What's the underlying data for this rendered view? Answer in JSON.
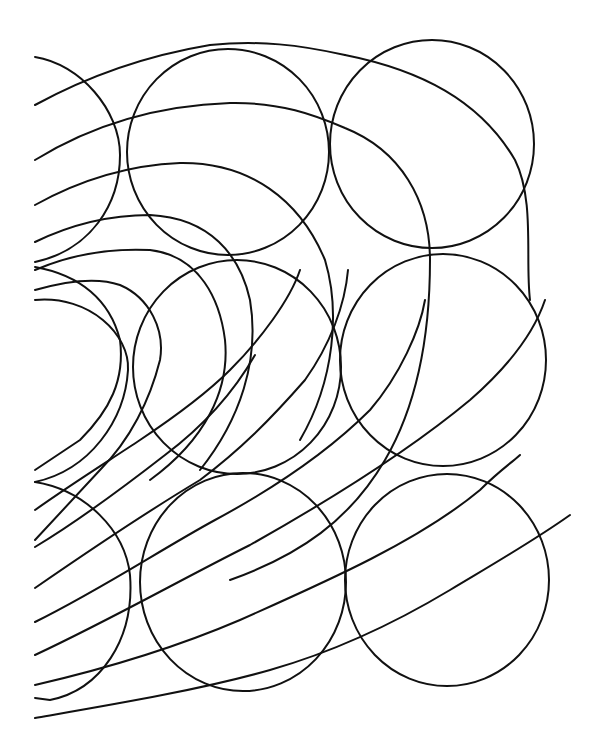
{
  "artwork": {
    "description": "Hand-drawn black ink line drawing of overlapping circles and sweeping arcs on white background",
    "background_color": "#ffffff",
    "ink_color": "#111111",
    "circles": [
      {
        "cx": 228,
        "cy": 153,
        "r": 102
      },
      {
        "cx": 432,
        "cy": 144,
        "r": 102
      },
      {
        "cx": 236,
        "cy": 367,
        "r": 104
      },
      {
        "cx": 443,
        "cy": 360,
        "r": 104
      },
      {
        "cx": 243,
        "cy": 581,
        "r": 104
      },
      {
        "cx": 447,
        "cy": 580,
        "r": 103
      },
      {
        "cx": 35,
        "cy": 163,
        "r": 86
      },
      {
        "cx": 20,
        "cy": 375,
        "r": 105
      },
      {
        "cx": 20,
        "cy": 595,
        "r": 120
      }
    ]
  }
}
